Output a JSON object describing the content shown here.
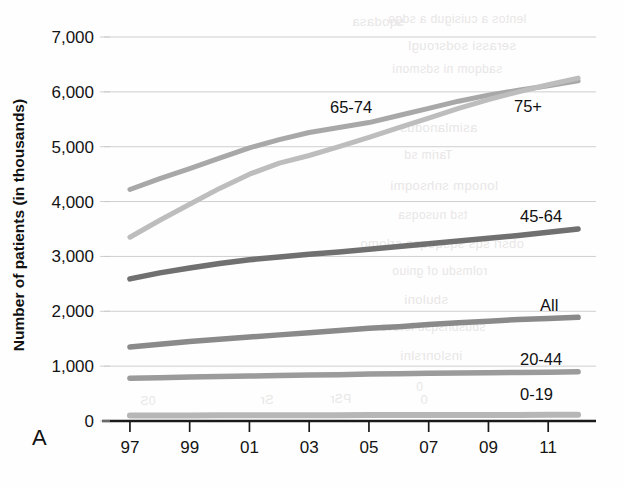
{
  "figure": {
    "panel_label": "A",
    "background_color": "#fefefe"
  },
  "ghost_text": [
    {
      "text": "sqodasa",
      "x": 352,
      "y": 14
    },
    {
      "text": "lentos a cuisigub a sdgo",
      "x": 388,
      "y": 12
    },
    {
      "text": "serassi sodsrougl",
      "x": 408,
      "y": 38
    },
    {
      "text": "sadqom ni sdsmoni",
      "x": 392,
      "y": 62
    },
    {
      "text": "asimlanodus",
      "x": 400,
      "y": 120
    },
    {
      "text": "Tarim sd",
      "x": 404,
      "y": 148
    },
    {
      "text": "lonoqm snhsoqmi",
      "x": 390,
      "y": 178
    },
    {
      "text": "tsd nusoqsa",
      "x": 398,
      "y": 208
    },
    {
      "text": "obsri sqs sqsqoqsa srlomo",
      "x": 360,
      "y": 236
    },
    {
      "text": "rolmsdu of gniuo",
      "x": 392,
      "y": 264
    },
    {
      "text": "sbuloni",
      "x": 404,
      "y": 292
    },
    {
      "text": "sbusbnsqsb lorsvs",
      "x": 380,
      "y": 320
    },
    {
      "text": "inslonrslni",
      "x": 400,
      "y": 348
    },
    {
      "text": "0",
      "x": 416,
      "y": 380
    },
    {
      "text": "Sr",
      "x": 260,
      "y": 392
    },
    {
      "text": "PSr",
      "x": 330,
      "y": 392
    },
    {
      "text": "0",
      "x": 420,
      "y": 392
    },
    {
      "text": "0S",
      "x": 140,
      "y": 394
    }
  ],
  "chart_data": {
    "type": "line",
    "title": "",
    "xlabel": "",
    "ylabel": "Number of patients (in thousands)",
    "xlim": [
      1996.4,
      2012.6
    ],
    "ylim": [
      0,
      7000
    ],
    "grid": true,
    "legend_position": "inline-right",
    "ytick_labels": [
      "0",
      "1,000",
      "2,000",
      "3,000",
      "4,000",
      "5,000",
      "6,000",
      "7,000"
    ],
    "ytick_values": [
      0,
      1000,
      2000,
      3000,
      4000,
      5000,
      6000,
      7000
    ],
    "xtick_labels": [
      "97",
      "99",
      "01",
      "03",
      "05",
      "07",
      "09",
      "11"
    ],
    "xtick_values": [
      1997,
      1999,
      2001,
      2003,
      2005,
      2007,
      2009,
      2011
    ],
    "x": [
      1997,
      1998,
      1999,
      2000,
      2001,
      2002,
      2003,
      2004,
      2005,
      2006,
      2007,
      2008,
      2009,
      2010,
      2011,
      2012
    ],
    "series": [
      {
        "name": "65-74",
        "label": "65-74",
        "color": "#a8a8a8",
        "stroke_width": 5.0,
        "label_x": 330,
        "label_y": 113,
        "values": [
          4220,
          4420,
          4600,
          4790,
          4980,
          5130,
          5260,
          5350,
          5440,
          5570,
          5700,
          5830,
          5940,
          6030,
          6110,
          6200
        ]
      },
      {
        "name": "75+",
        "label": "75+",
        "color": "#bdbdbd",
        "stroke_width": 5.0,
        "label_x": 514,
        "label_y": 112,
        "values": [
          3350,
          3660,
          3950,
          4240,
          4500,
          4700,
          4840,
          5000,
          5170,
          5350,
          5520,
          5700,
          5860,
          6000,
          6130,
          6250
        ]
      },
      {
        "name": "45-64",
        "label": "45-64",
        "color": "#707070",
        "stroke_width": 5.5,
        "label_x": 520,
        "label_y": 222,
        "values": [
          2590,
          2700,
          2790,
          2870,
          2940,
          2990,
          3040,
          3080,
          3130,
          3180,
          3230,
          3280,
          3330,
          3380,
          3440,
          3500
        ]
      },
      {
        "name": "All",
        "label": "All",
        "color": "#8a8a8a",
        "stroke_width": 5.5,
        "label_x": 540,
        "label_y": 311,
        "values": [
          1350,
          1400,
          1450,
          1490,
          1530,
          1570,
          1610,
          1650,
          1690,
          1720,
          1760,
          1790,
          1820,
          1850,
          1870,
          1890
        ]
      },
      {
        "name": "20-44",
        "label": "20-44",
        "color": "#9b9b9b",
        "stroke_width": 5.5,
        "label_x": 520,
        "label_y": 365,
        "values": [
          780,
          790,
          800,
          810,
          820,
          830,
          840,
          845,
          855,
          860,
          870,
          875,
          880,
          885,
          890,
          900
        ]
      },
      {
        "name": "0-19",
        "label": "0-19",
        "color": "#b6b6b6",
        "stroke_width": 6.0,
        "label_x": 520,
        "label_y": 400,
        "values": [
          100,
          100,
          102,
          103,
          104,
          105,
          106,
          107,
          108,
          108,
          109,
          110,
          110,
          111,
          112,
          112
        ]
      }
    ]
  }
}
